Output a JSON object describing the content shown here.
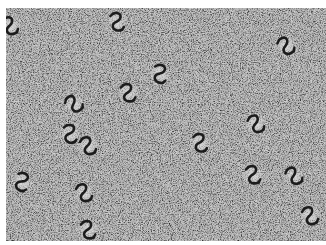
{
  "image": {
    "description": "Grayscale electron micrograph of S/Z-shaped (pinwheel) particles on a grainy background",
    "background_color": "#a9a9a9",
    "particle_color": "#1a1a1a",
    "halo_color": "#d8d8d8",
    "border_color": "#ffffff"
  },
  "particles": [
    {
      "x": 10,
      "y": 26,
      "rot": 0
    },
    {
      "x": 117,
      "y": 22,
      "rot": 15
    },
    {
      "x": 286,
      "y": 46,
      "rot": -10
    },
    {
      "x": 160,
      "y": 74,
      "rot": 30
    },
    {
      "x": 128,
      "y": 93,
      "rot": 10
    },
    {
      "x": 74,
      "y": 104,
      "rot": -20
    },
    {
      "x": 70,
      "y": 134,
      "rot": 20
    },
    {
      "x": 88,
      "y": 146,
      "rot": 0
    },
    {
      "x": 200,
      "y": 143,
      "rot": 15
    },
    {
      "x": 256,
      "y": 124,
      "rot": -5
    },
    {
      "x": 22,
      "y": 182,
      "rot": 40
    },
    {
      "x": 84,
      "y": 193,
      "rot": 0
    },
    {
      "x": 253,
      "y": 175,
      "rot": 10
    },
    {
      "x": 294,
      "y": 176,
      "rot": -10
    },
    {
      "x": 310,
      "y": 216,
      "rot": 0
    },
    {
      "x": 88,
      "y": 230,
      "rot": 10
    }
  ]
}
